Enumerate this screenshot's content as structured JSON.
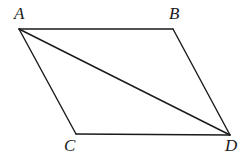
{
  "figure": {
    "kind": "geometry-diagram",
    "shape_name": "parallelogram",
    "background_color": "#ffffff",
    "stroke_color": "#1a1a1a",
    "stroke_width": 1.4,
    "canvas": {
      "width": 249,
      "height": 159
    },
    "vertices": [
      {
        "id": "A",
        "label": "A",
        "x": 19,
        "y": 29,
        "label_x": 14,
        "label_y": 5
      },
      {
        "id": "B",
        "label": "B",
        "x": 173,
        "y": 29,
        "label_x": 169,
        "label_y": 5
      },
      {
        "id": "C",
        "label": "C",
        "x": 76,
        "y": 134,
        "label_x": 64,
        "label_y": 137
      },
      {
        "id": "D",
        "label": "D",
        "x": 230,
        "y": 135,
        "label_x": 225,
        "label_y": 137
      }
    ],
    "edges": [
      {
        "id": "AB",
        "from": "A",
        "to": "B",
        "role": "top-side"
      },
      {
        "id": "BD",
        "from": "B",
        "to": "D",
        "role": "right-side"
      },
      {
        "id": "DC",
        "from": "D",
        "to": "C",
        "role": "bottom-side"
      },
      {
        "id": "CA",
        "from": "C",
        "to": "A",
        "role": "left-side"
      },
      {
        "id": "AD",
        "from": "A",
        "to": "D",
        "role": "diagonal"
      }
    ]
  }
}
